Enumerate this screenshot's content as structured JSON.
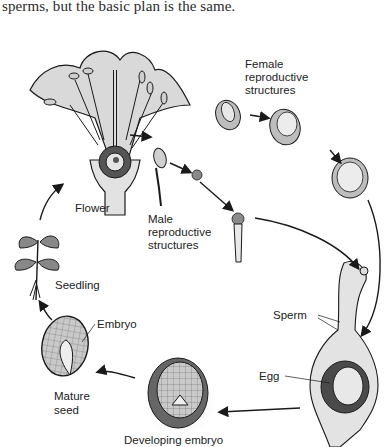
{
  "page": {
    "caption_partial": "sperms, but the basic plan is the same.",
    "caption_cut_top": "...through many stages... though the groups of plants vary,"
  },
  "diagram": {
    "labels": {
      "female": [
        "Female",
        "reproductive",
        "structures"
      ],
      "flower": "Flower",
      "male": [
        "Male",
        "reproductive",
        "structures"
      ],
      "seedling": "Seedling",
      "embryo": "Embryo",
      "mature_seed": [
        "Mature",
        "seed"
      ],
      "sperm": "Sperm",
      "egg": "Egg",
      "developing_embryo": "Developing embryo"
    },
    "stages": [
      "Flower",
      "Male reproductive structures",
      "Female reproductive structures",
      "Fertilization (Sperm, Egg)",
      "Developing embryo",
      "Mature seed",
      "Seedling"
    ],
    "colors": {
      "ink": "#1a1a1a",
      "shade": "#9a9a9a",
      "light_fill": "#d8d8d8",
      "dark_fill": "#555555"
    }
  }
}
